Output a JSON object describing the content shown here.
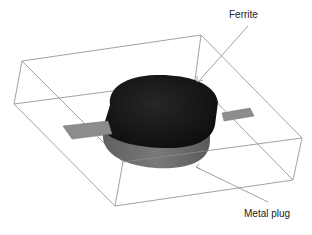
{
  "diagram": {
    "labels": {
      "ferrite": "Ferrite",
      "metal_plug": "Metal plug"
    },
    "colors": {
      "box_edges": "#8a8a8a",
      "ferrite": "#151515",
      "metal_plug": "#6e6e6e",
      "strip": "#8c8c8c",
      "leader_line": "#8a8a8a",
      "background": "#ffffff"
    }
  }
}
